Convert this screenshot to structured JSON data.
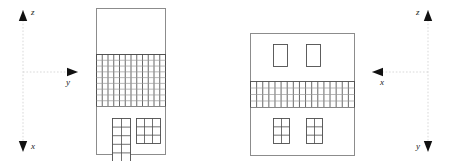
{
  "figure": {
    "kind": "orthographic-elevation-diagram",
    "width": 451,
    "height": 161,
    "background_color": "#ffffff",
    "outline_color": "#8c8c8c",
    "grid_color": "#4d4d4d",
    "fine_grid_color": "#9a9a9a",
    "axis_color": "#cfcfcf",
    "arrow_color": "#111111",
    "label_color": "#1a1a1a"
  },
  "axes": {
    "left": {
      "name": "left-coordinate-axes",
      "origin_x": 23,
      "origin_y": 72,
      "vertical_top_y": 10,
      "vertical_bottom_y": 152,
      "horizontal_right_x": 78,
      "up_label": "z",
      "down_label": "x",
      "right_label": "y",
      "up_label_x": 31,
      "up_label_y": 8,
      "down_label_x": 31,
      "down_label_y": 142,
      "right_label_x": 66,
      "right_label_y": 78
    },
    "right": {
      "name": "right-coordinate-axes",
      "origin_x": 428,
      "origin_y": 72,
      "vertical_top_y": 10,
      "vertical_bottom_y": 152,
      "horizontal_left_x": 372,
      "up_label": "z",
      "down_label": "y",
      "left_label": "x",
      "up_label_x": 416,
      "up_label_y": 8,
      "down_label_x": 416,
      "down_label_y": 142,
      "left_label_x": 380,
      "left_label_y": 78
    }
  },
  "buildings": [
    {
      "name": "left-building-elevation",
      "x": 96,
      "y": 8,
      "width": 69,
      "height": 146,
      "bands": [
        {
          "name": "upper-blank-band",
          "y": 8,
          "height": 46,
          "type": "blank"
        },
        {
          "name": "mesh-grid-band",
          "y": 54,
          "height": 52,
          "type": "grid",
          "columns": 12,
          "rows": 9
        },
        {
          "name": "lower-window-band",
          "y": 106,
          "height": 48,
          "type": "windows"
        }
      ],
      "windows": [
        {
          "name": "lower-left-window-grid",
          "x": 112,
          "y": 118,
          "width": 18,
          "height": 43,
          "columns": 2,
          "rows": 5
        },
        {
          "name": "lower-right-window-grid",
          "x": 136,
          "y": 118,
          "width": 24,
          "height": 25,
          "columns": 3,
          "rows": 3
        }
      ]
    },
    {
      "name": "right-building-elevation",
      "x": 250,
      "y": 33,
      "width": 104,
      "height": 122,
      "bands": [
        {
          "name": "upper-window-band",
          "y": 33,
          "height": 48,
          "type": "windows"
        },
        {
          "name": "mesh-grid-band",
          "y": 81,
          "height": 26,
          "type": "grid",
          "columns": 17,
          "rows": 4
        },
        {
          "name": "lower-window-band",
          "y": 107,
          "height": 48,
          "type": "windows"
        }
      ],
      "windows": [
        {
          "name": "upper-left-window",
          "x": 273,
          "y": 44,
          "width": 14,
          "height": 22,
          "columns": 1,
          "rows": 1
        },
        {
          "name": "upper-right-window",
          "x": 306,
          "y": 44,
          "width": 14,
          "height": 22,
          "columns": 1,
          "rows": 1
        },
        {
          "name": "lower-left-window-grid",
          "x": 273,
          "y": 118,
          "width": 16,
          "height": 25,
          "columns": 2,
          "rows": 3
        },
        {
          "name": "lower-right-window-grid",
          "x": 306,
          "y": 118,
          "width": 16,
          "height": 25,
          "columns": 2,
          "rows": 3
        }
      ]
    }
  ]
}
